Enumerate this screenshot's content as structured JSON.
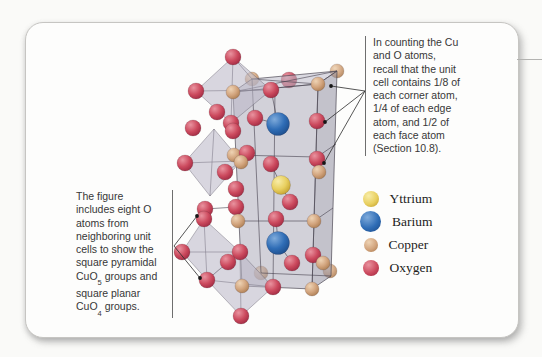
{
  "figure": {
    "notes": {
      "right": {
        "lines": [
          "In counting the Cu",
          "and O atoms,",
          "recall that the unit",
          "cell contains 1/8 of",
          "each corner atom,",
          "1/4 of each edge",
          "atom, and 1/2 of",
          "each face atom",
          "(Section 10.8)."
        ]
      },
      "left": {
        "lines": [
          "The figure",
          "includes eight O",
          "atoms from",
          "neighboring unit",
          "cells to show the",
          "square pyramidal",
          "CuO~5~ groups and",
          "square planar",
          "CuO~4~ groups."
        ]
      }
    },
    "legend": {
      "items": [
        {
          "element": "Y",
          "label": "Yttrium"
        },
        {
          "element": "Ba",
          "label": "Barium"
        },
        {
          "element": "Cu",
          "label": "Copper"
        },
        {
          "element": "O",
          "label": "Oxygen"
        }
      ],
      "sphere_px": {
        "Y": 16,
        "Ba": 21,
        "Cu": 14,
        "O": 16
      }
    },
    "elements": {
      "Y": {
        "color": "#e8cf5f",
        "hi": "#f8eda8",
        "lo": "#bf9c28",
        "r": 9.5
      },
      "Ba": {
        "color": "#2f6db6",
        "hi": "#7fabdb",
        "lo": "#1b4a88",
        "r": 11.5
      },
      "Cu": {
        "color": "#d2a47d",
        "hi": "#eed3b4",
        "lo": "#a97a4e",
        "r": 7
      },
      "O": {
        "color": "#cc4a5e",
        "hi": "#e9939f",
        "lo": "#9c2740",
        "r": 8
      }
    }
  },
  "structure": {
    "box": {
      "front": [
        [
          233,
          92
        ],
        [
          318,
          84
        ],
        [
          312,
          289
        ],
        [
          242,
          286
        ]
      ],
      "depth": [
        19,
        -13
      ],
      "fills": {
        "front": "rgba(168,165,182,0.50)",
        "top": "rgba(190,187,202,0.55)",
        "right": "rgba(148,145,163,0.55)"
      },
      "edge_color": "rgba(72,68,80,0.85)"
    },
    "polyhedra": [
      [
        [
          233,
          57
        ],
        [
          196,
          91
        ],
        [
          231,
          123
        ],
        [
          271,
          90
        ]
      ],
      [
        [
          214,
          129
        ],
        [
          184,
          163
        ],
        [
          210,
          196
        ],
        [
          241,
          161
        ]
      ],
      [
        [
          204,
          219
        ],
        [
          182,
          252
        ],
        [
          207,
          280
        ],
        [
          240,
          252
        ]
      ],
      [
        [
          240,
          252
        ],
        [
          207,
          280
        ],
        [
          241,
          316
        ],
        [
          273,
          287
        ]
      ]
    ],
    "poly_fill": "rgba(186,183,199,0.55)",
    "back_atoms": [
      [
        "Cu",
        337,
        71
      ],
      [
        "O",
        289,
        80
      ],
      [
        "Cu",
        252,
        79
      ],
      [
        "Cu",
        261,
        273
      ],
      [
        "Cu",
        330,
        271
      ]
    ],
    "atoms": [
      [
        "O",
        233,
        57
      ],
      [
        "O",
        196,
        91
      ],
      [
        "Cu",
        233,
        92
      ],
      [
        "O",
        271,
        90
      ],
      [
        "Cu",
        318,
        84
      ],
      [
        "O",
        217,
        112
      ],
      [
        "O",
        255,
        118
      ],
      [
        "Ba",
        278,
        124
      ],
      [
        "O",
        231,
        123
      ],
      [
        "O",
        317,
        121
      ],
      [
        "O",
        193,
        128
      ],
      [
        "O",
        233,
        131
      ],
      [
        "Cu",
        234,
        155
      ],
      [
        "O",
        247,
        153
      ],
      [
        "Cu",
        241,
        162
      ],
      [
        "O",
        185,
        163
      ],
      [
        "O",
        271,
        164
      ],
      [
        "O",
        317,
        159
      ],
      [
        "Cu",
        319,
        172
      ],
      [
        "O",
        225,
        172
      ],
      [
        "Y",
        281,
        185
      ],
      [
        "O",
        236,
        189
      ],
      [
        "O",
        290,
        202
      ],
      [
        "O",
        205,
        209
      ],
      [
        "O",
        236,
        207
      ],
      [
        "O",
        204,
        219
      ],
      [
        "Cu",
        238,
        221
      ],
      [
        "O",
        276,
        219
      ],
      [
        "Cu",
        314,
        221
      ],
      [
        "Ba",
        278,
        243
      ],
      [
        "O",
        182,
        252
      ],
      [
        "O",
        240,
        252
      ],
      [
        "O",
        228,
        262
      ],
      [
        "O",
        313,
        255
      ],
      [
        "Cu",
        323,
        263
      ],
      [
        "O",
        292,
        263
      ],
      [
        "O",
        207,
        280
      ],
      [
        "Cu",
        242,
        286
      ],
      [
        "O",
        273,
        287
      ],
      [
        "Cu",
        312,
        289
      ],
      [
        "O",
        241,
        316
      ]
    ],
    "bonds": [
      [
        252,
        79,
        261,
        273
      ],
      [
        261,
        273,
        331,
        276
      ],
      [
        234,
        155,
        317,
        157
      ],
      [
        238,
        221,
        314,
        221
      ],
      [
        317,
        157,
        336,
        144
      ],
      [
        314,
        221,
        333,
        208
      ],
      [
        275,
        88,
        273,
        290
      ],
      [
        233,
        92,
        337,
        71
      ],
      [
        252,
        79,
        318,
        84
      ],
      [
        233,
        57,
        231,
        123
      ],
      [
        196,
        91,
        271,
        90
      ],
      [
        233,
        57,
        252,
        79
      ],
      [
        214,
        129,
        210,
        196
      ],
      [
        184,
        163,
        241,
        161
      ],
      [
        241,
        161,
        234,
        155
      ],
      [
        204,
        219,
        207,
        280
      ],
      [
        182,
        252,
        240,
        252
      ],
      [
        240,
        252,
        241,
        316
      ],
      [
        207,
        280,
        273,
        287
      ],
      [
        281,
        185,
        271,
        164
      ],
      [
        281,
        185,
        290,
        202
      ],
      [
        278,
        243,
        276,
        219
      ],
      [
        278,
        243,
        292,
        263
      ],
      [
        278,
        124,
        255,
        118
      ],
      [
        278,
        124,
        271,
        90
      ],
      [
        225,
        172,
        241,
        162
      ],
      [
        205,
        209,
        236,
        207
      ]
    ],
    "arrows": {
      "right": {
        "from": [
          365,
          91
        ],
        "to": [
          [
            331,
            86
          ],
          [
            325,
            122
          ],
          [
            324,
            163
          ]
        ]
      },
      "left": {
        "from": [
          174,
          246
        ],
        "to": [
          [
            197,
            216
          ],
          [
            200,
            278
          ]
        ]
      }
    },
    "dot_color": "#161616",
    "line_color": "#2b2b2b"
  }
}
